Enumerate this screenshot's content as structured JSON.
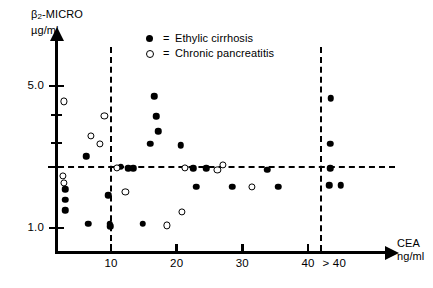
{
  "chart_data": {
    "type": "scatter",
    "title": "",
    "ylabel": "β₂-MICRO",
    "yunit": "µg/ml",
    "xlabel": "CEA",
    "xunit": "ng/ml",
    "y_ticks_labeled": [
      "5.0",
      "1.0"
    ],
    "y_ticks_all": [
      5.0,
      3.6,
      2.6,
      2.0,
      1.0
    ],
    "x_ticks": [
      "10",
      "20",
      "30",
      "40",
      "> 40"
    ],
    "xlim": [
      0,
      48
    ],
    "ylim": [
      0.85,
      6.2
    ],
    "y_scale": "log",
    "grid": false,
    "reference_lines": {
      "horizontal": [
        2.0
      ],
      "vertical": [
        10,
        42
      ]
    },
    "legend_position": "top-center",
    "series": [
      {
        "name": "Ethylic cirrhosis",
        "marker": "filled-circle",
        "color": "#000000",
        "points": [
          [
            6.2,
            2.25
          ],
          [
            3.0,
            1.55
          ],
          [
            3.0,
            1.38
          ],
          [
            3.0,
            1.22
          ],
          [
            6.5,
            1.05
          ],
          [
            9.6,
            1.45
          ],
          [
            9.8,
            1.05
          ],
          [
            9.9,
            1.02
          ],
          [
            11.5,
            2.0
          ],
          [
            12.6,
            1.97
          ],
          [
            13.4,
            1.97
          ],
          [
            14.8,
            1.05
          ],
          [
            16.0,
            2.6
          ],
          [
            16.6,
            4.45
          ],
          [
            16.9,
            3.55
          ],
          [
            17.2,
            3.0
          ],
          [
            20.6,
            2.55
          ],
          [
            22.5,
            1.97
          ],
          [
            24.5,
            1.97
          ],
          [
            23.0,
            1.6
          ],
          [
            28.5,
            1.6
          ],
          [
            33.8,
            1.94
          ],
          [
            35.5,
            1.6
          ],
          [
            43.5,
            4.35
          ],
          [
            43.4,
            2.6
          ],
          [
            43.4,
            1.97
          ],
          [
            43.2,
            1.62
          ],
          [
            45.0,
            1.62
          ]
        ]
      },
      {
        "name": "Chronic pancreatitis",
        "marker": "open-circle",
        "color": "#000000",
        "points": [
          [
            2.8,
            4.2
          ],
          [
            9.0,
            3.55
          ],
          [
            6.9,
            2.85
          ],
          [
            8.3,
            2.6
          ],
          [
            2.7,
            1.8
          ],
          [
            2.8,
            1.66
          ],
          [
            10.9,
            1.97
          ],
          [
            12.2,
            1.5
          ],
          [
            18.5,
            1.03
          ],
          [
            20.8,
            1.2
          ],
          [
            21.2,
            1.97
          ],
          [
            27.0,
            2.05
          ],
          [
            26.2,
            1.94
          ],
          [
            31.5,
            1.6
          ]
        ]
      }
    ]
  },
  "legend": {
    "items": [
      {
        "marker": "filled-circle",
        "equals": "=",
        "label": "Ethylic cirrhosis"
      },
      {
        "marker": "open-circle",
        "equals": "=",
        "label": "Chronic pancreatitis"
      }
    ]
  },
  "axes": {
    "y": {
      "title_main": "β",
      "title_sub": "2",
      "title_rest": "-MICRO",
      "title_unit": "µg/ml",
      "labels": [
        {
          "text": "5.0",
          "value": 5.0
        },
        {
          "text": "1.0",
          "value": 1.0
        }
      ]
    },
    "x": {
      "title_main": "CEA",
      "title_unit": "ng/ml",
      "labels": [
        {
          "text": "10",
          "value": 10
        },
        {
          "text": "20",
          "value": 20
        },
        {
          "text": "30",
          "value": 30
        },
        {
          "text": "40",
          "value": 40
        },
        {
          "text": "> 40",
          "value": 44
        }
      ]
    }
  }
}
